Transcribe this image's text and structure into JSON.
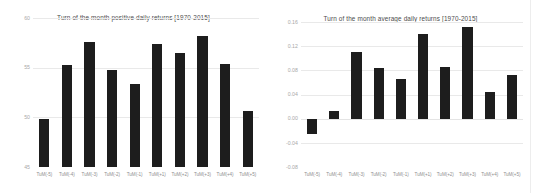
{
  "chart_data": [
    {
      "type": "bar",
      "title": "Turn of the month positive daily returns [1970-2015]",
      "xlabel": "",
      "ylabel": "",
      "ylim": [
        45,
        60
      ],
      "yticks": [
        "45",
        "50",
        "55",
        "60"
      ],
      "ytick_values": [
        45,
        50,
        55,
        60
      ],
      "grid": true,
      "legend": "none",
      "categories": [
        "TuM(-5)",
        "TuM(-4)",
        "TuM(-3)",
        "TuM(-2)",
        "TuM(-1)",
        "TuM(+1)",
        "TuM(+2)",
        "TuM(+3)",
        "TuM(+4)",
        "TuM(+5)"
      ],
      "values": [
        49.8,
        55.3,
        57.6,
        54.8,
        53.4,
        57.4,
        56.5,
        58.2,
        55.4,
        50.6
      ],
      "bar_color": "#1d1d1d"
    },
    {
      "type": "bar",
      "title": "Turn of the month average daily returns [1970-2015]",
      "xlabel": "",
      "ylabel": "",
      "ylim": [
        -0.08,
        0.16
      ],
      "yticks": [
        "-0.08",
        "-0.04",
        "0.00",
        "0.04",
        "0.08",
        "0.12",
        "0.16"
      ],
      "ytick_values": [
        -0.08,
        -0.04,
        0.0,
        0.04,
        0.08,
        0.12,
        0.16
      ],
      "grid": true,
      "legend": "none",
      "categories": [
        "TuM(-5)",
        "TuM(-4)",
        "TuM(-3)",
        "TuM(-2)",
        "TuM(-1)",
        "TuM(+1)",
        "TuM(+2)",
        "TuM(+3)",
        "TuM(+4)",
        "TuM(+5)"
      ],
      "values": [
        -0.025,
        0.013,
        0.11,
        0.084,
        0.066,
        0.14,
        0.085,
        0.152,
        0.044,
        0.073
      ],
      "bar_color": "#1d1d1d"
    }
  ]
}
